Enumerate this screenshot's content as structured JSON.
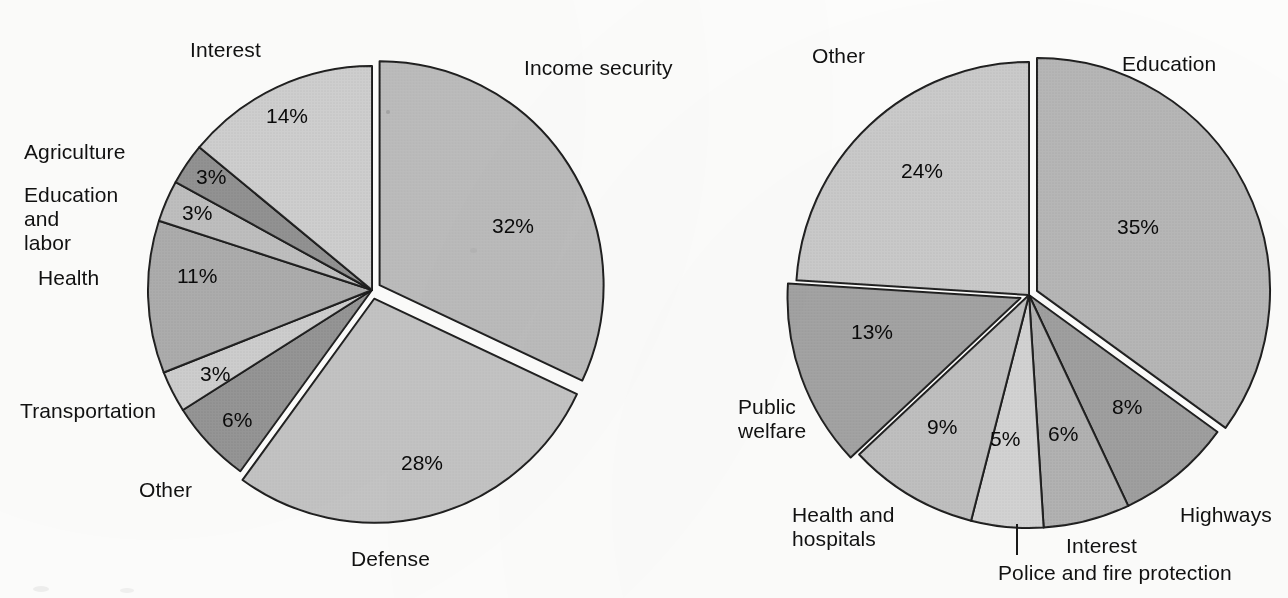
{
  "figure": {
    "background_color": "#fdfdfc",
    "ink_color": "#111111",
    "slice_edge_color": "#1a1a1a"
  },
  "chart_data": [
    {
      "type": "pie",
      "title": "",
      "id": "federal-spending",
      "center": [
        372,
        290
      ],
      "radius": 224,
      "start_angle_deg": -90,
      "direction": "clockwise",
      "legend": "labels placed outside slices",
      "categories": [
        "Income security",
        "Defense",
        "Other",
        "Transportation",
        "Health",
        "Education and labor",
        "Agriculture",
        "Interest"
      ],
      "values": [
        32,
        28,
        6,
        3,
        11,
        3,
        3,
        14
      ],
      "value_labels": [
        "32%",
        "28%",
        "6%",
        "3%",
        "11%",
        "3%",
        "3%",
        "14%"
      ],
      "slice_colors": [
        "#b9b9b9",
        "#c2c2c2",
        "#8f8f8f",
        "#cccccc",
        "#a8a8a8",
        "#bcbcbc",
        "#8c8c8c",
        "#cdcdcd"
      ],
      "exploded": [
        "Income security",
        "Defense"
      ],
      "labeled_outside": [
        "Interest",
        "Agriculture",
        "Education and labor",
        "Health",
        "Transportation",
        "Other",
        "Defense",
        "Income security"
      ]
    },
    {
      "type": "pie",
      "title": "",
      "id": "state-local-spending",
      "center": [
        1029,
        295
      ],
      "radius": 233,
      "start_angle_deg": -90,
      "direction": "clockwise",
      "legend": "labels placed outside slices",
      "categories": [
        "Education",
        "Highways",
        "Interest",
        "Police and fire protection",
        "Health and hospitals",
        "Public welfare",
        "Other"
      ],
      "values": [
        35,
        8,
        6,
        5,
        9,
        13,
        24
      ],
      "value_labels": [
        "35%",
        "8%",
        "6%",
        "5%",
        "9%",
        "13%",
        "24%"
      ],
      "slice_colors": [
        "#b3b3b3",
        "#9a9a9a",
        "#aeaeae",
        "#d2d2d2",
        "#bdbdbd",
        "#9e9e9e",
        "#c8c8c8"
      ],
      "exploded": [
        "Education",
        "Public welfare"
      ],
      "labeled_outside": [
        "Education",
        "Highways",
        "Interest",
        "Police and fire protection",
        "Health and hospitals",
        "Public welfare",
        "Other"
      ]
    }
  ],
  "left_chart": {
    "labels": {
      "interest": "Interest",
      "agriculture": "Agriculture",
      "education_and_labor": "Education\nand\nlabor",
      "health": "Health",
      "transportation": "Transportation",
      "other": "Other",
      "defense": "Defense",
      "income_security": "Income security"
    },
    "percents": {
      "interest": "14%",
      "agriculture": "3%",
      "education_and_labor": "3%",
      "health": "11%",
      "transportation": "3%",
      "other": "6%",
      "defense": "28%",
      "income_security": "32%"
    }
  },
  "right_chart": {
    "labels": {
      "other": "Other",
      "education": "Education",
      "public_welfare": "Public\nwelfare",
      "health_and_hospitals": "Health and\nhospitals",
      "police_and_fire": "Police and fire protection",
      "interest": "Interest",
      "highways": "Highways"
    },
    "percents": {
      "other": "24%",
      "education": "35%",
      "public_welfare": "13%",
      "health_and_hospitals": "9%",
      "police_and_fire": "5%",
      "interest": "6%",
      "highways": "8%"
    }
  }
}
